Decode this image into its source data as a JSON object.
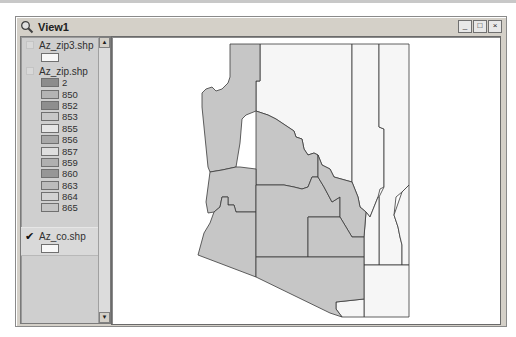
{
  "window": {
    "title": "View1",
    "controls": {
      "minimize": "_",
      "maximize": "□",
      "close": "×"
    }
  },
  "toc": {
    "themes": [
      {
        "name": "Az_zip3.shp",
        "visible": false,
        "symbol_color": "#f8f8f8"
      },
      {
        "name": "Az_zip.shp",
        "visible": false,
        "classes": [
          {
            "label": "2",
            "color": "#8c8c8c"
          },
          {
            "label": "850",
            "color": "#b4b4b4"
          },
          {
            "label": "852",
            "color": "#8e8e8e"
          },
          {
            "label": "853",
            "color": "#c8c8c8"
          },
          {
            "label": "855",
            "color": "#e6e6e6"
          },
          {
            "label": "856",
            "color": "#a8a8a8"
          },
          {
            "label": "857",
            "color": "#dedede"
          },
          {
            "label": "859",
            "color": "#b0b0b0"
          },
          {
            "label": "860",
            "color": "#969696"
          },
          {
            "label": "863",
            "color": "#bcbcbc"
          },
          {
            "label": "864",
            "color": "#d2d2d2"
          },
          {
            "label": "865",
            "color": "#c4c4c4"
          }
        ]
      },
      {
        "name": "Az_co.shp",
        "visible": true,
        "symbol_color": "#f8f8f8"
      }
    ],
    "scroll_up": "▲",
    "scroll_down": "▼"
  },
  "map": {
    "shaded_color": "#c6c6c6",
    "unshaded_color": "#f6f6f6",
    "border_color": "#3a3a3a"
  }
}
